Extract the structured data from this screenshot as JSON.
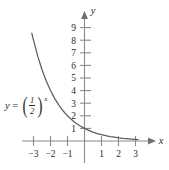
{
  "chart_data": {
    "type": "line",
    "title": "",
    "subtitle": "",
    "xlabel": "x",
    "ylabel": "y",
    "xlim": [
      -3.6,
      3.6
    ],
    "ylim": [
      -0.7,
      9.8
    ],
    "grid": false,
    "legend": null,
    "annotations": [
      {
        "name": "function-equation",
        "text": "y = (1/2)^x",
        "lhs": "y",
        "equals": "=",
        "base_numerator": "1",
        "base_denominator": "2",
        "exponent": "x"
      }
    ],
    "xticks": [
      -3,
      -2,
      -1,
      1,
      2,
      3
    ],
    "xtick_labels": [
      "−3",
      "−2",
      "−1",
      "1",
      "2",
      "3"
    ],
    "yticks": [
      1,
      2,
      3,
      4,
      5,
      6,
      7,
      8,
      9
    ],
    "ytick_labels": [
      "1",
      "2",
      "3",
      "4",
      "5",
      "6",
      "7",
      "8",
      "9"
    ],
    "series": [
      {
        "name": "y = (1/2)^x",
        "color": "#5d5d5d",
        "x": [
          -3.1,
          -3.0,
          -2.75,
          -2.5,
          -2.25,
          -2.0,
          -1.75,
          -1.5,
          -1.25,
          -1.0,
          -0.75,
          -0.5,
          -0.25,
          0.0,
          0.25,
          0.5,
          0.75,
          1.0,
          1.25,
          1.5,
          1.75,
          2.0,
          2.25,
          2.5,
          2.75,
          3.0,
          3.15
        ],
        "y": [
          8.57,
          8.0,
          6.73,
          5.66,
          4.76,
          4.0,
          3.36,
          2.83,
          2.38,
          2.0,
          1.68,
          1.41,
          1.19,
          1.0,
          0.84,
          0.71,
          0.59,
          0.5,
          0.42,
          0.35,
          0.3,
          0.25,
          0.21,
          0.18,
          0.15,
          0.125,
          0.11
        ]
      }
    ]
  },
  "axes": {
    "x_axis_label": "x",
    "y_axis_label": "y"
  },
  "colors": {
    "axis": "#8a8a8a",
    "curve": "#5d5d5d",
    "text": "#2b2b2b",
    "background": "#ffffff"
  }
}
